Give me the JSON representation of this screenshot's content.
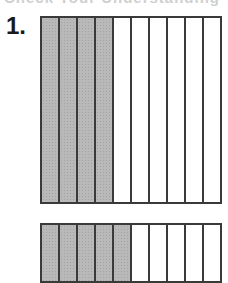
{
  "heading_clipped": "Check Your Understanding",
  "problem": {
    "number_label": "1."
  },
  "colors": {
    "shaded": "#b9b9b9",
    "border": "#3a3a3a",
    "background": "#ffffff"
  },
  "fraction_bars": [
    {
      "total_parts": 10,
      "shaded_parts": 4
    },
    {
      "total_parts": 10,
      "shaded_parts": 5
    }
  ]
}
